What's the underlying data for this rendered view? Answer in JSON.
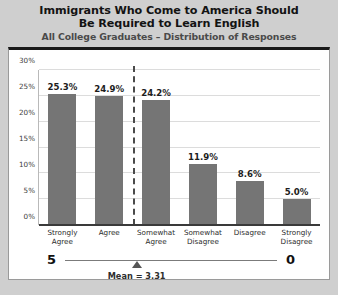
{
  "chart_data": {
    "type": "bar",
    "title": "Immigrants Who Come to America Should Be Required to Learn English",
    "title_lines": [
      "Immigrants Who Come to America Should",
      "Be Required to Learn English"
    ],
    "subtitle": "All College Graduates – Distribution of Responses",
    "categories": [
      "Strongly Agree",
      "Agree",
      "Somewhat Agree",
      "Somewhat Disagree",
      "Disagree",
      "Strongly Disagree"
    ],
    "category_lines": [
      [
        "Strongly",
        "Agree"
      ],
      [
        "Agree",
        ""
      ],
      [
        "Somewhat",
        "Agree"
      ],
      [
        "Somewhat",
        "Disagree"
      ],
      [
        "Disagree",
        ""
      ],
      [
        "Strongly",
        "Disagree"
      ]
    ],
    "values": [
      25.3,
      24.9,
      24.2,
      11.9,
      8.6,
      5.0
    ],
    "value_labels": [
      "25.3%",
      "24.9%",
      "24.2%",
      "11.9%",
      "8.6%",
      "5.0%"
    ],
    "xlabel": "",
    "ylabel": "",
    "ylim": [
      0,
      30
    ],
    "yticks": [
      0,
      5,
      10,
      15,
      20,
      25,
      30
    ],
    "ytick_labels": [
      "0%",
      "5%",
      "10%",
      "15%",
      "20%",
      "25%",
      "30%"
    ],
    "grid": true,
    "legend": false,
    "bar_color": "#757575",
    "divider": {
      "after_category_index": 1,
      "style": "dashed",
      "color": "#4a4a4a"
    },
    "annotations": {
      "scale_left": "5",
      "scale_right": "0",
      "mean_label": "Mean = 3.31",
      "mean_value": 3.31
    }
  },
  "colors": {
    "header_background": "#cfcfcf",
    "panel_background": "#ffffff",
    "panel_border": "#9a9a9a",
    "panel_top_rule": "#1a1a1a",
    "bar": "#757575",
    "gridline": "#dcdcdc",
    "axis": "#3a3a3a",
    "text": "#131313"
  }
}
